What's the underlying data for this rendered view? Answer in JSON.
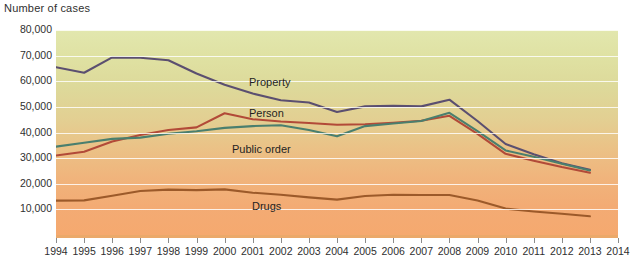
{
  "chart_data": {
    "type": "line",
    "title": "",
    "ylabel": "Number of cases",
    "xlabel": "",
    "grid": true,
    "legend_position": "inline-labels",
    "ylim": [
      0,
      80000
    ],
    "yticks": [
      80000,
      70000,
      60000,
      50000,
      40000,
      30000,
      20000,
      10000
    ],
    "ytick_labels": [
      "80,000",
      "70,000",
      "60,000",
      "50,000",
      "40,000",
      "30,000",
      "20,000",
      "10,000"
    ],
    "xlim": [
      1994,
      2014
    ],
    "x": [
      1994,
      1995,
      1996,
      1997,
      1998,
      1999,
      2000,
      2001,
      2002,
      2003,
      2004,
      2005,
      2006,
      2007,
      2008,
      2009,
      2010,
      2011,
      2012,
      2013
    ],
    "xtick_labels": [
      "1994",
      "1995",
      "1996",
      "1997",
      "1998",
      "1999",
      "2000",
      "2001",
      "2002",
      "2003",
      "2004",
      "2005",
      "2006",
      "2007",
      "2008",
      "2009",
      "2010",
      "2011",
      "2012",
      "2013",
      "2014"
    ],
    "series": [
      {
        "name": "Property",
        "color": "#5b4f70",
        "values": [
          65500,
          63300,
          69300,
          69200,
          68200,
          63000,
          58600,
          55200,
          52600,
          51700,
          48000,
          50200,
          50400,
          50200,
          52800,
          44500,
          35500,
          31500,
          28000,
          25500
        ]
      },
      {
        "name": "Person",
        "color": "#b24a38",
        "values": [
          31000,
          32500,
          36500,
          39000,
          41000,
          42000,
          47500,
          45200,
          44300,
          43700,
          43000,
          43200,
          43800,
          44600,
          46500,
          39500,
          31700,
          29000,
          26500,
          24300
        ]
      },
      {
        "name": "Public order",
        "color": "#4a7f6e",
        "values": [
          34500,
          36000,
          37500,
          38000,
          39500,
          40500,
          41800,
          42500,
          42800,
          41000,
          38500,
          42500,
          43500,
          44500,
          47700,
          40500,
          33000,
          30500,
          27800,
          25200
        ]
      },
      {
        "name": "Drugs",
        "color": "#9c5a2a",
        "values": [
          13400,
          13500,
          15300,
          17200,
          17700,
          17500,
          17800,
          16500,
          15700,
          14700,
          13800,
          15200,
          15700,
          15600,
          15600,
          13500,
          10300,
          9200,
          8300,
          7300
        ]
      }
    ]
  },
  "labels": {
    "axis_title": "Number of cases",
    "property": "Property",
    "person": "Person",
    "public_order": "Public order",
    "drugs": "Drugs"
  }
}
